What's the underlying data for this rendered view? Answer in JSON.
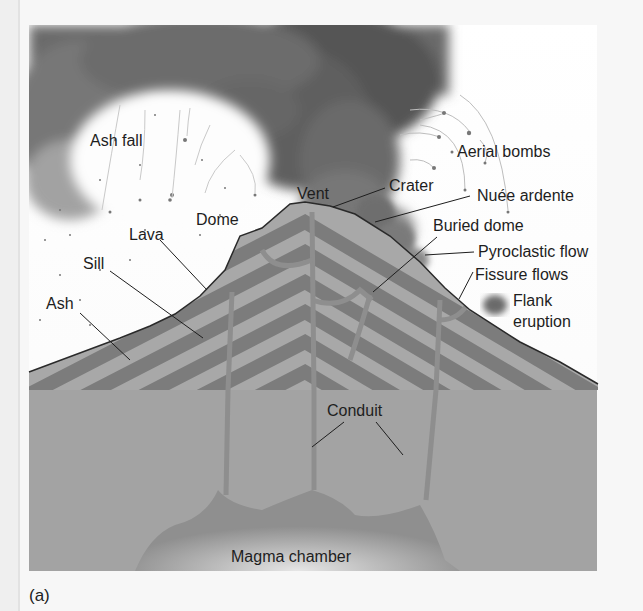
{
  "figure": {
    "caption": "(a)",
    "colors": {
      "background": "#f7f7f7",
      "ash_cloud_dark": "#5a5a5a",
      "ash_cloud_light": "#8a8a8a",
      "layer_light": "#a8a8a8",
      "layer_dark": "#7c7c7c",
      "ground": "#a3a3a3",
      "magma": "#8f8f8f",
      "magma_glow": "#d9d9d9",
      "label_text": "#1e1e1e"
    }
  },
  "labels": {
    "ash_fall": "Ash fall",
    "aerial_bombs": "Aerial bombs",
    "vent": "Vent",
    "crater": "Crater",
    "nuee_ardente": "Nuée ardente",
    "dome": "Dome",
    "buried_dome": "Buried dome",
    "lava": "Lava",
    "pyroclastic_flow": "Pyroclastic flow",
    "sill": "Sill",
    "fissure_flows": "Fissure flows",
    "flank_eruption_line1": "Flank",
    "flank_eruption_line2": "eruption",
    "ash": "Ash",
    "conduit": "Conduit",
    "magma_chamber": "Magma chamber"
  }
}
